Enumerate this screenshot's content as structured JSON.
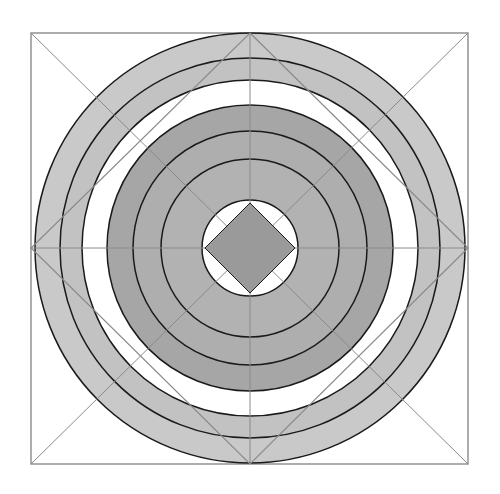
{
  "figure": {
    "canvas": {
      "width": 500,
      "height": 494,
      "background": "#ffffff"
    },
    "center": {
      "x": 250,
      "y": 248
    },
    "palette": {
      "stroke_dark": "#1a1a1a",
      "stroke_thin": "#8a8a8a",
      "ring_light": "#c9c9c9",
      "ring_mid": "#b5b5b5",
      "ring_dark": "#a6a6a6",
      "core_diamond": "#9a9a9a",
      "white": "#ffffff"
    },
    "square": {
      "label": "outer-square",
      "x": 31,
      "y": 33,
      "width": 437,
      "height": 431,
      "fill": "none",
      "stroke": "#8a8a8a",
      "stroke_width": 1.4
    },
    "diamond_outer": {
      "label": "outer-diamond",
      "points": "250,33 468,248 250,464 31,248",
      "fill": "none",
      "stroke": "#8a8a8a",
      "stroke_width": 1.2
    },
    "diamond_inner_center": {
      "label": "center-diamond",
      "points": "250,203 295,248 250,293 205,248",
      "fill": "#9a9a9a",
      "stroke": "#1a1a1a",
      "stroke_width": 1.0
    },
    "circles": [
      {
        "name": "circle-1-outer",
        "r": 215,
        "fill": "#c9c9c9",
        "stroke": "#1a1a1a",
        "stroke_width": 1.5
      },
      {
        "name": "circle-2",
        "r": 190,
        "fill": "#c2c2c2",
        "stroke": "#1a1a1a",
        "stroke_width": 1.5
      },
      {
        "name": "circle-3-white-gap",
        "r": 168,
        "fill": "#ffffff",
        "stroke": "#1a1a1a",
        "stroke_width": 1.5
      },
      {
        "name": "circle-4-dark",
        "r": 143,
        "fill": "#a6a6a6",
        "stroke": "#1a1a1a",
        "stroke_width": 1.5
      },
      {
        "name": "circle-5-dark",
        "r": 117,
        "fill": "#aeaeae",
        "stroke": "#1a1a1a",
        "stroke_width": 1.5
      },
      {
        "name": "circle-6-dark",
        "r": 89,
        "fill": "#b2b2b2",
        "stroke": "#1a1a1a",
        "stroke_width": 1.5
      },
      {
        "name": "circle-7-inner-white",
        "r": 48,
        "fill": "#ffffff",
        "stroke": "#1a1a1a",
        "stroke_width": 1.5
      }
    ],
    "radial_lines": [
      {
        "name": "axis-vertical",
        "x1": 250,
        "y1": 33,
        "x2": 250,
        "y2": 464
      },
      {
        "name": "axis-horizontal",
        "x1": 31,
        "y1": 248,
        "x2": 468,
        "y2": 248
      }
    ],
    "corner_lines": [
      {
        "name": "diagonal-top-left-to-bottom-right",
        "x1": 31,
        "y1": 33,
        "x2": 468,
        "y2": 464
      },
      {
        "name": "diagonal-top-right-to-bottom-left",
        "x1": 468,
        "y1": 33,
        "x2": 31,
        "y2": 464
      }
    ]
  },
  "chart_data": {
    "type": "scatter",
    "xlabel": "",
    "ylabel": "",
    "categories": [
      "circle-1-outer",
      "circle-2",
      "circle-3-white-gap",
      "circle-4-dark",
      "circle-5-dark",
      "circle-6-dark",
      "circle-7-inner-white"
    ],
    "values": [
      215,
      190,
      168,
      143,
      117,
      89,
      48
    ],
    "series": [
      {
        "name": "radius_px",
        "values": [
          215,
          190,
          168,
          143,
          117,
          89,
          48
        ]
      }
    ],
    "annotations": [
      "outer square 437x431 px",
      "outer diamond vertices at square edge midpoints",
      "center diamond half-diagonal 45 px"
    ]
  }
}
